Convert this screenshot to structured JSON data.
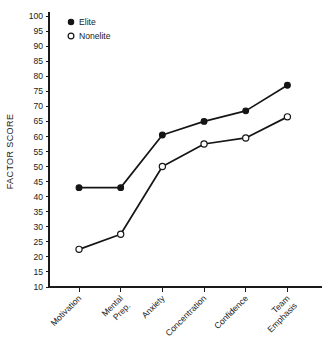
{
  "chart_data": {
    "type": "line",
    "title": "",
    "xlabel": "",
    "ylabel": "FACTOR SCORE",
    "categories": [
      "Motivation",
      "Mental Prep.",
      "Anxiety",
      "Concentration",
      "Confidence",
      "Team Emphasis"
    ],
    "ylim": [
      10,
      100
    ],
    "yticks": [
      10,
      15,
      20,
      25,
      30,
      35,
      40,
      45,
      50,
      55,
      60,
      65,
      70,
      75,
      80,
      85,
      90,
      95,
      100
    ],
    "grid": false,
    "legend_position": "top-left-inside",
    "series": [
      {
        "name": "Elite",
        "marker": "filled-circle",
        "values": [
          43,
          43,
          60.5,
          65,
          68.5,
          77
        ]
      },
      {
        "name": "Nonelite",
        "marker": "open-circle",
        "values": [
          22.5,
          27.5,
          50,
          57.5,
          59.5,
          66.5
        ]
      }
    ]
  },
  "legend": {
    "items": [
      {
        "label": "Elite",
        "marker": "filled-circle"
      },
      {
        "label": "Nonelite",
        "marker": "open-circle"
      }
    ]
  },
  "axes": {
    "y_title": "FACTOR SCORE",
    "y_tick_labels": [
      "100",
      "95",
      "90",
      "85",
      "80",
      "75",
      "70",
      "65",
      "60",
      "55",
      "50",
      "45",
      "40",
      "35",
      "30",
      "25",
      "20",
      "15",
      "10"
    ],
    "x_tick_labels": [
      "Motivation",
      "Mental\nPrep.",
      "Anxiety",
      "Concentration",
      "Confidence",
      "Team\nEmphasis"
    ]
  },
  "colors": {
    "ink": "#151515",
    "background": "#ffffff"
  }
}
